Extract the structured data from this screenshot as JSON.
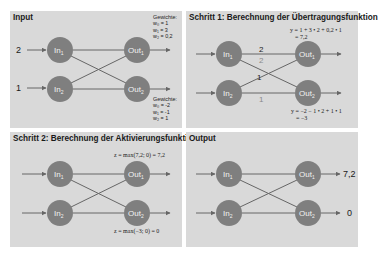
{
  "colors": {
    "panel_bg": "#d9d9d9",
    "node_fill": "#7f7f7f",
    "edge": "#666666",
    "edge_label_dark": "#222222",
    "edge_label_faded": "#8a8a8a"
  },
  "nodes": {
    "in1": {
      "main": "In",
      "sub": "1"
    },
    "in2": {
      "main": "In",
      "sub": "2"
    },
    "out1": {
      "main": "Out",
      "sub": "1"
    },
    "out2": {
      "main": "Out",
      "sub": "2"
    }
  },
  "panels": [
    {
      "title": "Input",
      "inputs": [
        "2",
        "1"
      ],
      "weights_out1": {
        "heading": "Gewichte:",
        "lines": [
          "w₀ = 1",
          "w₁ = 3",
          "w₂ = 0,2"
        ]
      },
      "weights_out2": {
        "heading": "Gewichte:",
        "lines": [
          "w₀ = -2",
          "w₁ = -1",
          "w₂ = 1"
        ]
      }
    },
    {
      "title": "Schritt 1: Berechnung der Übertragungsfunktion",
      "edge_labels": [
        "2",
        "2",
        "1",
        "1"
      ],
      "formula_out1": [
        "y = 1 + 3 • 2 + 0,2 • 1",
        "= 7,2"
      ],
      "formula_out2": [
        "y = −2 − 1 • 2 + 1 • 1",
        "= −3"
      ]
    },
    {
      "title": "Schritt 2: Berechnung der Aktivierungsfunktion",
      "formula_out1": "z = max(7,2; 0) = 7,2",
      "formula_out2": "z = max(−3; 0) = 0"
    },
    {
      "title": "Output",
      "outputs": [
        "7,2",
        "0"
      ]
    }
  ]
}
